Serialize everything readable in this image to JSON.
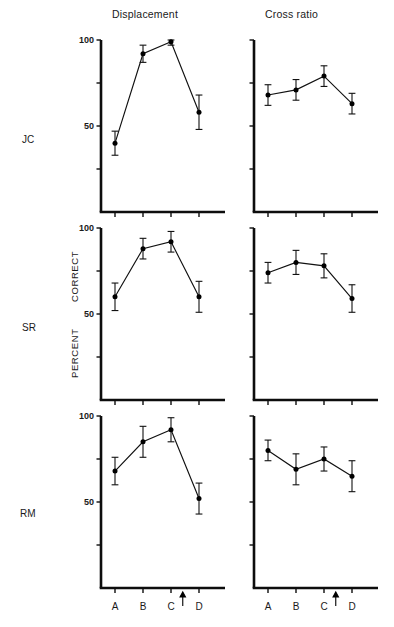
{
  "figure": {
    "column_titles": [
      "Displacement",
      "Cross ratio"
    ],
    "row_labels": [
      "JC",
      "SR",
      "RM"
    ],
    "y_axis_label_top": "PERCENT",
    "y_axis_label_bottom": "CORRECT",
    "y_tick_labels": [
      "100",
      "50"
    ],
    "x_tick_labels": [
      "A",
      "B",
      "C",
      "D"
    ],
    "arrow_marker": "up-arrow",
    "ink_color": "#0d0d0d"
  },
  "chart_data": [
    {
      "type": "line",
      "title": "Displacement",
      "subject": "JC",
      "xlabel": "",
      "ylabel": "PERCENT CORRECT",
      "categories": [
        "A",
        "B",
        "C",
        "D"
      ],
      "values": [
        40,
        92,
        99,
        58
      ],
      "errors": [
        7,
        5,
        2,
        10
      ],
      "ylim": [
        0,
        100
      ],
      "yticks": [
        25,
        50,
        75,
        100
      ],
      "ytick_labels_shown": [
        "100",
        "50"
      ],
      "grid": false,
      "legend": "none",
      "annotation": "arrow between C and D"
    },
    {
      "type": "line",
      "title": "Cross ratio",
      "subject": "JC",
      "xlabel": "",
      "ylabel": "",
      "categories": [
        "A",
        "B",
        "C",
        "D"
      ],
      "values": [
        68,
        71,
        79,
        63
      ],
      "errors": [
        6,
        6,
        6,
        6
      ],
      "ylim": [
        0,
        100
      ],
      "yticks": [
        25,
        50,
        75,
        100
      ],
      "ytick_labels_shown": [],
      "grid": false,
      "legend": "none",
      "annotation": "arrow between C and D"
    },
    {
      "type": "line",
      "title": "Displacement",
      "subject": "SR",
      "xlabel": "",
      "ylabel": "PERCENT CORRECT",
      "categories": [
        "A",
        "B",
        "C",
        "D"
      ],
      "values": [
        60,
        88,
        92,
        60
      ],
      "errors": [
        8,
        6,
        6,
        9
      ],
      "ylim": [
        0,
        100
      ],
      "yticks": [
        25,
        50,
        75,
        100
      ],
      "ytick_labels_shown": [
        "100",
        "50"
      ],
      "grid": false,
      "legend": "none",
      "annotation": "arrow between C and D"
    },
    {
      "type": "line",
      "title": "Cross ratio",
      "subject": "SR",
      "xlabel": "",
      "ylabel": "",
      "categories": [
        "A",
        "B",
        "C",
        "D"
      ],
      "values": [
        74,
        80,
        78,
        59
      ],
      "errors": [
        6,
        7,
        7,
        8
      ],
      "ylim": [
        0,
        100
      ],
      "yticks": [
        25,
        50,
        75,
        100
      ],
      "ytick_labels_shown": [],
      "grid": false,
      "legend": "none",
      "annotation": "arrow between C and D"
    },
    {
      "type": "line",
      "title": "Displacement",
      "subject": "RM",
      "xlabel": "",
      "ylabel": "",
      "categories": [
        "A",
        "B",
        "C",
        "D"
      ],
      "values": [
        68,
        85,
        92,
        52
      ],
      "errors": [
        8,
        9,
        7,
        9
      ],
      "ylim": [
        0,
        100
      ],
      "yticks": [
        25,
        50,
        75,
        100
      ],
      "ytick_labels_shown": [
        "100",
        "50"
      ],
      "grid": false,
      "legend": "none",
      "annotation": "arrow between C and D"
    },
    {
      "type": "line",
      "title": "Cross ratio",
      "subject": "RM",
      "xlabel": "",
      "ylabel": "",
      "categories": [
        "A",
        "B",
        "C",
        "D"
      ],
      "values": [
        80,
        69,
        75,
        65
      ],
      "errors": [
        6,
        9,
        7,
        9
      ],
      "ylim": [
        0,
        100
      ],
      "yticks": [
        25,
        50,
        75,
        100
      ],
      "ytick_labels_shown": [],
      "grid": false,
      "legend": "none",
      "annotation": "arrow between C and D"
    }
  ]
}
